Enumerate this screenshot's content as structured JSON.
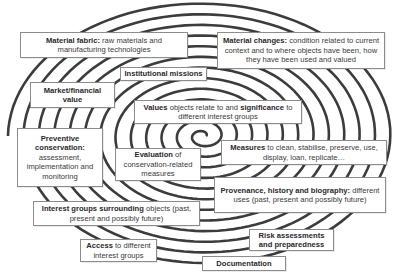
{
  "diagram": {
    "type": "spiral-concept-map",
    "colors": {
      "spiral": "#3c3c3c",
      "box_border": "#8c8c8c",
      "text": "#3a3a3a",
      "background": "#ffffff"
    },
    "boxes": [
      {
        "id": "material-fabric",
        "bold": "Material fabric:",
        "text": " raw materials and manufacturing technologies"
      },
      {
        "id": "material-changes",
        "bold": "Material changes:",
        "text": " condition related to current context and to where objects have been, how they have been used and valued"
      },
      {
        "id": "institutional-missions",
        "bold": "Institutional missions",
        "text": ""
      },
      {
        "id": "market-financial-value",
        "bold": "Market/financial value",
        "text": ""
      },
      {
        "id": "values-significance",
        "bold": "Values",
        "text": " objects relate to and ",
        "bold2": "significance",
        "text2": " to different interest groups"
      },
      {
        "id": "preventive-conservation",
        "bold": "Preventive conservation:",
        "text": " assessment, implementation and monitoring"
      },
      {
        "id": "evaluation",
        "bold": "Evaluation",
        "text": " of conservation-related measures"
      },
      {
        "id": "measures",
        "bold": "Measures",
        "text": " to clean, stabilise, preserve, use, display, loan, replicate…"
      },
      {
        "id": "provenance",
        "bold": "Provenance, history and biography:",
        "text": " different uses (past, present and possibly future)"
      },
      {
        "id": "interest-groups",
        "bold": "Interest groups surrounding",
        "text": " objects (past, present and possibly future)"
      },
      {
        "id": "risk-assessments",
        "bold": "Risk assessments and preparedness",
        "text": ""
      },
      {
        "id": "access",
        "bold": "Access",
        "text": " to different interest groups"
      },
      {
        "id": "documentation",
        "bold": "Documentation",
        "text": ""
      }
    ]
  }
}
